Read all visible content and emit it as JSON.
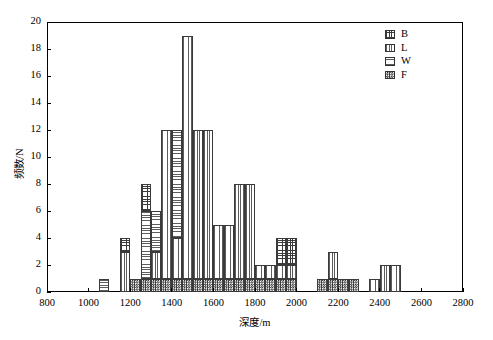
{
  "chart_data": {
    "type": "bar",
    "subtype": "stacked-histogram",
    "title": "",
    "xlabel": "深度/m",
    "ylabel": "频数/N",
    "xlim": [
      800,
      2800
    ],
    "ylim": [
      0,
      20
    ],
    "xticks": [
      800,
      1000,
      1200,
      1400,
      1600,
      1800,
      2000,
      2200,
      2400,
      2600,
      2800
    ],
    "xtick_labels": [
      "800",
      "1000",
      "1200",
      "1400",
      "1600",
      "1800",
      "2000",
      "2200",
      "2400",
      "2600",
      "2800"
    ],
    "yticks": [
      0,
      2,
      4,
      6,
      8,
      10,
      12,
      14,
      16,
      18,
      20
    ],
    "ytick_labels": [
      "0",
      "2",
      "4",
      "6",
      "8",
      "10",
      "12",
      "14",
      "16",
      "18",
      "20"
    ],
    "grid": false,
    "bin_width": 50,
    "legend": {
      "position": "top-right",
      "entries": [
        {
          "key": "B",
          "label": "B",
          "pattern": "crosshatch-grid"
        },
        {
          "key": "L",
          "label": "L",
          "pattern": "vertical-lines"
        },
        {
          "key": "W",
          "label": "W",
          "pattern": "horizontal-lines"
        },
        {
          "key": "F",
          "label": "F",
          "pattern": "dense-checker"
        }
      ]
    },
    "series": [
      {
        "name": "F",
        "pattern": "dense-checker"
      },
      {
        "name": "W",
        "pattern": "horizontal-lines"
      },
      {
        "name": "L",
        "pattern": "vertical-lines"
      },
      {
        "name": "B",
        "pattern": "crosshatch-grid"
      }
    ],
    "bins": [
      {
        "x0": 1050,
        "x1": 1100,
        "total": 1,
        "segments": [
          {
            "s": "W",
            "v": 1
          }
        ]
      },
      {
        "x0": 1150,
        "x1": 1200,
        "total": 4,
        "segments": [
          {
            "s": "L",
            "v": 3
          },
          {
            "s": "B",
            "v": 1
          }
        ]
      },
      {
        "x0": 1200,
        "x1": 1250,
        "total": 1,
        "segments": [
          {
            "s": "F",
            "v": 1
          }
        ]
      },
      {
        "x0": 1250,
        "x1": 1300,
        "total": 8,
        "segments": [
          {
            "s": "F",
            "v": 1
          },
          {
            "s": "W",
            "v": 5
          },
          {
            "s": "B",
            "v": 2
          }
        ]
      },
      {
        "x0": 1300,
        "x1": 1350,
        "total": 6,
        "segments": [
          {
            "s": "F",
            "v": 1
          },
          {
            "s": "L",
            "v": 2
          },
          {
            "s": "W",
            "v": 3
          }
        ]
      },
      {
        "x0": 1350,
        "x1": 1400,
        "total": 12,
        "segments": [
          {
            "s": "F",
            "v": 1
          },
          {
            "s": "L",
            "v": 11
          }
        ]
      },
      {
        "x0": 1400,
        "x1": 1450,
        "total": 12,
        "segments": [
          {
            "s": "F",
            "v": 1
          },
          {
            "s": "L",
            "v": 3
          },
          {
            "s": "W",
            "v": 8
          }
        ]
      },
      {
        "x0": 1450,
        "x1": 1500,
        "total": 19,
        "segments": [
          {
            "s": "F",
            "v": 1
          },
          {
            "s": "L",
            "v": 18
          }
        ]
      },
      {
        "x0": 1500,
        "x1": 1550,
        "total": 12,
        "segments": [
          {
            "s": "F",
            "v": 1
          },
          {
            "s": "L",
            "v": 11
          }
        ]
      },
      {
        "x0": 1550,
        "x1": 1600,
        "total": 12,
        "segments": [
          {
            "s": "F",
            "v": 1
          },
          {
            "s": "L",
            "v": 11
          }
        ]
      },
      {
        "x0": 1600,
        "x1": 1650,
        "total": 5,
        "segments": [
          {
            "s": "F",
            "v": 1
          },
          {
            "s": "L",
            "v": 4
          }
        ]
      },
      {
        "x0": 1650,
        "x1": 1700,
        "total": 5,
        "segments": [
          {
            "s": "F",
            "v": 1
          },
          {
            "s": "L",
            "v": 4
          }
        ]
      },
      {
        "x0": 1700,
        "x1": 1750,
        "total": 8,
        "segments": [
          {
            "s": "F",
            "v": 1
          },
          {
            "s": "L",
            "v": 7
          }
        ]
      },
      {
        "x0": 1750,
        "x1": 1800,
        "total": 8,
        "segments": [
          {
            "s": "F",
            "v": 1
          },
          {
            "s": "L",
            "v": 7
          }
        ]
      },
      {
        "x0": 1800,
        "x1": 1850,
        "total": 2,
        "segments": [
          {
            "s": "F",
            "v": 1
          },
          {
            "s": "L",
            "v": 1
          }
        ]
      },
      {
        "x0": 1850,
        "x1": 1900,
        "total": 2,
        "segments": [
          {
            "s": "F",
            "v": 1
          },
          {
            "s": "L",
            "v": 1
          }
        ]
      },
      {
        "x0": 1900,
        "x1": 1950,
        "total": 4,
        "segments": [
          {
            "s": "F",
            "v": 1
          },
          {
            "s": "L",
            "v": 1
          },
          {
            "s": "B",
            "v": 2
          }
        ]
      },
      {
        "x0": 1950,
        "x1": 2000,
        "total": 4,
        "segments": [
          {
            "s": "F",
            "v": 1
          },
          {
            "s": "L",
            "v": 1
          },
          {
            "s": "B",
            "v": 2
          }
        ]
      },
      {
        "x0": 2100,
        "x1": 2150,
        "total": 1,
        "segments": [
          {
            "s": "F",
            "v": 1
          }
        ]
      },
      {
        "x0": 2150,
        "x1": 2200,
        "total": 3,
        "segments": [
          {
            "s": "F",
            "v": 1
          },
          {
            "s": "L",
            "v": 2
          }
        ]
      },
      {
        "x0": 2200,
        "x1": 2250,
        "total": 1,
        "segments": [
          {
            "s": "F",
            "v": 1
          }
        ]
      },
      {
        "x0": 2250,
        "x1": 2300,
        "total": 1,
        "segments": [
          {
            "s": "F",
            "v": 1
          }
        ]
      },
      {
        "x0": 2350,
        "x1": 2400,
        "total": 1,
        "segments": [
          {
            "s": "L",
            "v": 1
          }
        ]
      },
      {
        "x0": 2400,
        "x1": 2450,
        "total": 2,
        "segments": [
          {
            "s": "L",
            "v": 2
          }
        ]
      },
      {
        "x0": 2450,
        "x1": 2500,
        "total": 2,
        "segments": [
          {
            "s": "L",
            "v": 2
          }
        ]
      }
    ]
  },
  "geometry": {
    "plot_left": 47,
    "plot_top": 22,
    "plot_right": 463,
    "plot_bottom": 292
  }
}
